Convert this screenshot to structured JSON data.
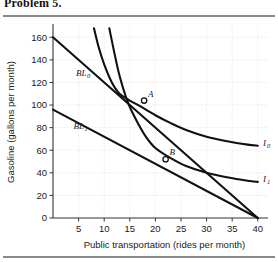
{
  "figure": {
    "title": "Problem 5.",
    "background": "#ffffff",
    "line_color": "#111111",
    "grid_color": "#d9d9d9",
    "axis_color": "#333333"
  },
  "chart_data": {
    "type": "line",
    "title": "",
    "xlabel": "Public transportation (rides per month)",
    "ylabel": "Gasoline (gallons per month)",
    "xlim": [
      0,
      42
    ],
    "ylim": [
      0,
      170
    ],
    "xticks": [
      5,
      10,
      15,
      20,
      25,
      30,
      35,
      40
    ],
    "yticks": [
      0,
      20,
      40,
      60,
      80,
      100,
      120,
      140,
      160
    ],
    "xtick_labels": [
      "5",
      "10",
      "15",
      "20",
      "25",
      "30",
      "35",
      "40"
    ],
    "ytick_labels": [
      "0",
      "20",
      "40",
      "60",
      "80",
      "100",
      "120",
      "140",
      "160"
    ],
    "grid": true,
    "legend": "inline-labels",
    "series": [
      {
        "name": "BL_0",
        "label": "BL",
        "sublabel": "0",
        "type": "budget-line",
        "points": [
          [
            0,
            160
          ],
          [
            40,
            0
          ]
        ],
        "label_xy": [
          4.5,
          126
        ]
      },
      {
        "name": "BL_1",
        "label": "BL",
        "sublabel": "1",
        "type": "budget-line",
        "points": [
          [
            0,
            96
          ],
          [
            40,
            0
          ]
        ],
        "label_xy": [
          4.0,
          79
        ]
      },
      {
        "name": "I_0",
        "label": "I",
        "sublabel": "0",
        "type": "indifference-curve",
        "points": [
          [
            8.0,
            168
          ],
          [
            9.0,
            150
          ],
          [
            10.0,
            136
          ],
          [
            11.5,
            120
          ],
          [
            13.0,
            110
          ],
          [
            15.0,
            104
          ],
          [
            17.0,
            99
          ],
          [
            20.0,
            91
          ],
          [
            23.0,
            84
          ],
          [
            26.0,
            78
          ],
          [
            30.0,
            72
          ],
          [
            34.0,
            68
          ],
          [
            38.0,
            65
          ],
          [
            40.0,
            64
          ]
        ],
        "label_xy": [
          41.0,
          64
        ]
      },
      {
        "name": "I_1",
        "label": "I",
        "sublabel": "1",
        "type": "indifference-curve",
        "points": [
          [
            11.0,
            168
          ],
          [
            12.0,
            146
          ],
          [
            13.0,
            126
          ],
          [
            14.5,
            104
          ],
          [
            16.0,
            89
          ],
          [
            18.0,
            73
          ],
          [
            20.0,
            62
          ],
          [
            23.0,
            53
          ],
          [
            26.0,
            46
          ],
          [
            30.0,
            40
          ],
          [
            34.0,
            36
          ],
          [
            38.0,
            33
          ],
          [
            40.0,
            32
          ]
        ],
        "label_xy": [
          41.0,
          32
        ]
      }
    ],
    "annotations": [
      {
        "name": "point-A",
        "label": "A",
        "x": 17.8,
        "y": 104,
        "marker": "open-circle",
        "label_dx": 4,
        "label_dy": -4
      },
      {
        "name": "point-B",
        "label": "B",
        "x": 22.0,
        "y": 52,
        "marker": "open-circle",
        "label_dx": 4,
        "label_dy": -4
      }
    ]
  }
}
